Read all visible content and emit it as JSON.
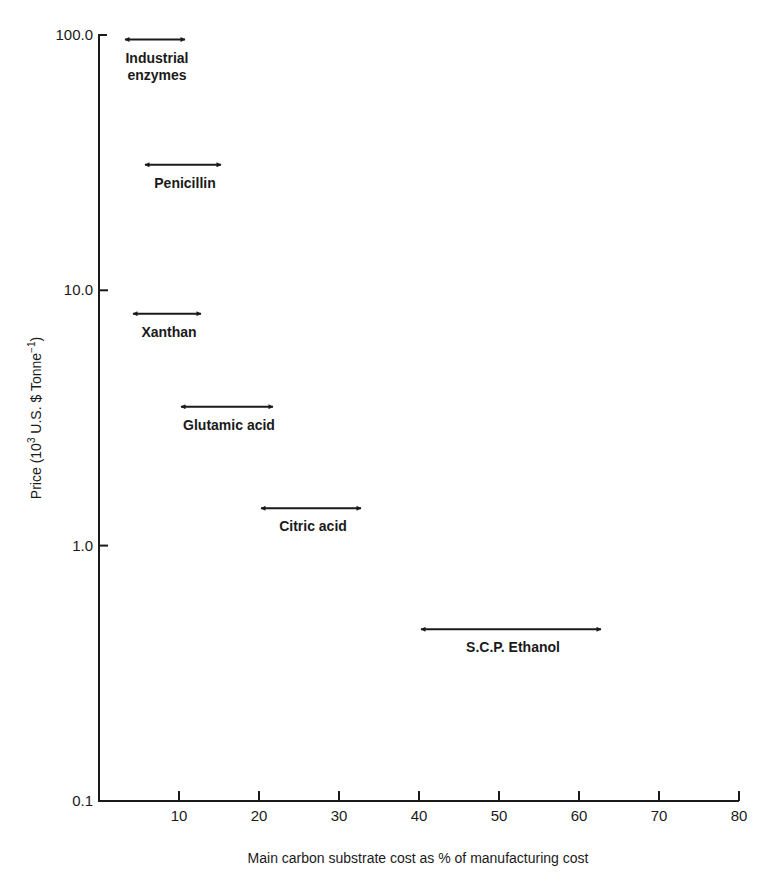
{
  "chart_data": {
    "type": "range",
    "title": "",
    "xlabel": "Main carbon substrate cost as % of manufacturing cost",
    "ylabel": "Price (10³ U.S. $ Tonne⁻¹)",
    "ylabel_parts": {
      "prefix": "Price (10",
      "sup1": "3",
      "middle": " U.S. $ Tonne",
      "sup2": "−1",
      "suffix": ")"
    },
    "x_range": [
      0,
      80
    ],
    "y_range": [
      0.1,
      100.0
    ],
    "y_scale": "log",
    "x_ticks": [
      10,
      20,
      30,
      40,
      50,
      60,
      70,
      80
    ],
    "y_ticks": [
      "100.0",
      "10.0",
      "1.0",
      "0.1"
    ],
    "grid": false,
    "series": [
      {
        "name": "Industrial enzymes",
        "label_lines": [
          "Industrial",
          "enzymes"
        ],
        "x_min": 3,
        "x_max": 11,
        "price": 96
      },
      {
        "name": "Penicillin",
        "label_lines": [
          "Penicillin"
        ],
        "x_min": 5.5,
        "x_max": 15.5,
        "price": 31
      },
      {
        "name": "Xanthan",
        "label_lines": [
          "Xanthan"
        ],
        "x_min": 4,
        "x_max": 13,
        "price": 8.1
      },
      {
        "name": "Glutamic acid",
        "label_lines": [
          "Glutamic acid"
        ],
        "x_min": 10,
        "x_max": 22,
        "price": 3.5
      },
      {
        "name": "Citric acid",
        "label_lines": [
          "Citric acid"
        ],
        "x_min": 20,
        "x_max": 33,
        "price": 1.4
      },
      {
        "name": "S.C.P. Ethanol",
        "label_lines": [
          "S.C.P. Ethanol"
        ],
        "x_min": 40,
        "x_max": 63,
        "price": 0.47
      }
    ]
  }
}
